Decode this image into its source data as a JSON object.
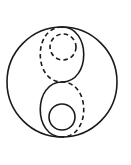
{
  "figure": {
    "name": "taijitu-variant-symbol",
    "background_color": "#ffffff",
    "stroke_color": "#1a1a1a",
    "stroke_width": 1.6,
    "canvas": {
      "width": 131,
      "height": 165
    }
  },
  "geometry": {
    "outer_circle": {
      "label": "outer-circle",
      "style": "solid",
      "center_x": 62,
      "center_y": 82,
      "radius": 55
    },
    "divider_solid": {
      "label": "s-curve-solid",
      "style": "solid",
      "path": "M 62 27 C 91 27 91 82 62 82 C 33 82 33 137 62 137",
      "top_point": [
        62,
        27
      ],
      "mid_point": [
        62,
        82
      ],
      "bottom_point": [
        62,
        137
      ]
    },
    "divider_dashed": {
      "label": "s-curve-dashed",
      "style": "dashed",
      "path": "M 62 27 C 33 27 33 82 62 82 C 91 82 91 137 62 137",
      "top_point": [
        62,
        27
      ],
      "mid_point": [
        62,
        82
      ],
      "bottom_point": [
        62,
        137
      ]
    },
    "upper_small_circle": {
      "label": "upper-small-circle",
      "style": "dashed",
      "center_x": 63,
      "center_y": 47,
      "radius": 13
    },
    "lower_small_circle": {
      "label": "lower-small-circle",
      "style": "solid",
      "center_x": 62,
      "center_y": 117,
      "radius": 13
    },
    "dash_pattern": "4.5 3.2"
  },
  "labels": {
    "title": "",
    "caption": "",
    "annotations": []
  }
}
